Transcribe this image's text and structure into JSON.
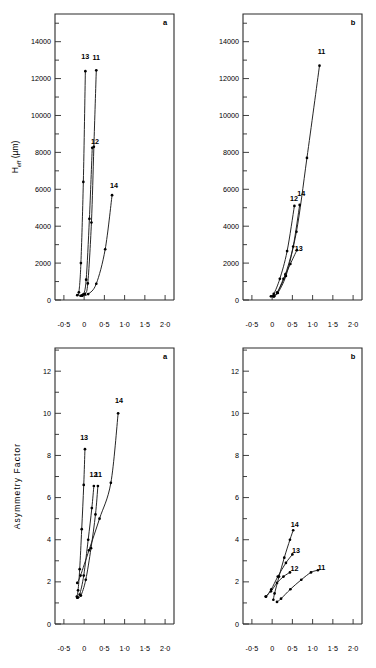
{
  "figure": {
    "panel_labels": [
      "a",
      "b",
      "a",
      "b"
    ],
    "xlabel": "k'",
    "xticklabels": [
      "-0·5",
      "0",
      "0·5",
      "1·0",
      "1·5",
      "2·0"
    ],
    "xticks": [
      -0.5,
      0,
      0.5,
      1.0,
      1.5,
      2.0
    ],
    "xlim": [
      -0.72,
      2.22
    ],
    "top_ylabel_main": "H",
    "top_ylabel_sub": "eff",
    "top_ylabel_unit": "(µm)",
    "bottom_ylabel": "Asymmetry Factor",
    "top_yticklabels": [
      "0",
      "2000",
      "4000",
      "6000",
      "8000",
      "10000",
      "12000",
      "14000"
    ],
    "top_yticks": [
      0,
      2000,
      4000,
      6000,
      8000,
      10000,
      12000,
      14000
    ],
    "top_ylim": [
      0,
      15500
    ],
    "bottom_yticklabels": [
      "0",
      "2",
      "4",
      "6",
      "8",
      "10",
      "12"
    ],
    "bottom_yticks": [
      0,
      2,
      4,
      6,
      8,
      10,
      12
    ],
    "bottom_ylim": [
      0,
      13.1
    ],
    "curve_ids": [
      "11",
      "12",
      "13",
      "14"
    ]
  },
  "chart_data": [
    {
      "type": "line",
      "title": "",
      "panel": "a",
      "position": "top-left",
      "xlabel": "k'",
      "ylabel": "H eff (µm)",
      "xlim": [
        -0.72,
        2.22
      ],
      "ylim": [
        0,
        15500
      ],
      "xticks": [
        -0.5,
        0,
        0.5,
        1.0,
        1.5,
        2.0
      ],
      "yticks": [
        0,
        2000,
        4000,
        6000,
        8000,
        10000,
        12000,
        14000
      ],
      "grid": false,
      "legend": "inline-curve-labels",
      "series": [
        {
          "name": "11",
          "label_xy": [
            0.3,
            13000
          ],
          "points": [
            [
              -0.05,
              250
            ],
            [
              0.02,
              330
            ],
            [
              0.09,
              900
            ],
            [
              0.18,
              4200
            ],
            [
              0.24,
              8300
            ],
            [
              0.3,
              12450
            ]
          ]
        },
        {
          "name": "12",
          "label_xy": [
            0.27,
            8450
          ],
          "points": [
            [
              -0.09,
              230
            ],
            [
              -0.02,
              300
            ],
            [
              0.05,
              1100
            ],
            [
              0.13,
              4400
            ],
            [
              0.2,
              8250
            ]
          ]
        },
        {
          "name": "13",
          "label_xy": [
            0.03,
            13050
          ],
          "points": [
            [
              -0.17,
              260
            ],
            [
              -0.13,
              420
            ],
            [
              -0.08,
              2000
            ],
            [
              -0.02,
              6400
            ],
            [
              0.03,
              12400
            ]
          ]
        },
        {
          "name": "14",
          "label_xy": [
            0.74,
            6050
          ],
          "points": [
            [
              -0.05,
              230
            ],
            [
              0.1,
              320
            ],
            [
              0.3,
              880
            ],
            [
              0.52,
              2750
            ],
            [
              0.69,
              5680
            ]
          ]
        }
      ]
    },
    {
      "type": "line",
      "title": "",
      "panel": "b",
      "position": "top-right",
      "xlabel": "k'",
      "ylabel": "H eff (µm)",
      "xlim": [
        -0.72,
        2.22
      ],
      "ylim": [
        0,
        15500
      ],
      "xticks": [
        -0.5,
        0,
        0.5,
        1.0,
        1.5,
        2.0
      ],
      "yticks": [
        0,
        2000,
        4000,
        6000,
        8000,
        10000,
        12000,
        14000
      ],
      "grid": false,
      "legend": "inline-curve-labels",
      "series": [
        {
          "name": "11",
          "label_xy": [
            1.22,
            13350
          ],
          "points": [
            [
              0.02,
              210
            ],
            [
              0.12,
              400
            ],
            [
              0.33,
              1400
            ],
            [
              0.6,
              3700
            ],
            [
              0.86,
              7700
            ],
            [
              1.17,
              12700
            ]
          ]
        },
        {
          "name": "12",
          "label_xy": [
            0.54,
            5350
          ],
          "points": [
            [
              -0.03,
              200
            ],
            [
              0.04,
              330
            ],
            [
              0.19,
              1150
            ],
            [
              0.37,
              2650
            ],
            [
              0.55,
              5100
            ]
          ]
        },
        {
          "name": "13",
          "label_xy": [
            0.66,
            2680
          ],
          "points": [
            [
              0.05,
              200
            ],
            [
              0.13,
              400
            ],
            [
              0.28,
              1150
            ],
            [
              0.45,
              1950
            ],
            [
              0.61,
              2700
            ]
          ]
        },
        {
          "name": "14",
          "label_xy": [
            0.72,
            5620
          ],
          "points": [
            [
              0.04,
              200
            ],
            [
              0.14,
              380
            ],
            [
              0.34,
              1300
            ],
            [
              0.52,
              2900
            ],
            [
              0.68,
              5150
            ]
          ]
        }
      ]
    },
    {
      "type": "line",
      "title": "",
      "panel": "a",
      "position": "bottom-left",
      "xlabel": "k'",
      "ylabel": "Asymmetry Factor",
      "xlim": [
        -0.72,
        2.22
      ],
      "ylim": [
        0,
        13.1
      ],
      "xticks": [
        -0.5,
        0,
        0.5,
        1.0,
        1.5,
        2.0
      ],
      "yticks": [
        0,
        2,
        4,
        6,
        8,
        10,
        12
      ],
      "grid": false,
      "legend": "inline-curve-labels",
      "series": [
        {
          "name": "11",
          "label_xy": [
            0.35,
            7.0
          ],
          "points": [
            [
              -0.16,
              1.25
            ],
            [
              -0.08,
              1.35
            ],
            [
              0.04,
              2.1
            ],
            [
              0.17,
              3.6
            ],
            [
              0.28,
              5.2
            ],
            [
              0.34,
              6.55
            ]
          ]
        },
        {
          "name": "12",
          "label_xy": [
            0.23,
            7.0
          ],
          "points": [
            [
              -0.17,
              1.25
            ],
            [
              -0.11,
              1.4
            ],
            [
              -0.01,
              2.3
            ],
            [
              0.1,
              4.0
            ],
            [
              0.19,
              5.5
            ],
            [
              0.24,
              6.55
            ]
          ]
        },
        {
          "name": "13",
          "label_xy": [
            0.0,
            8.75
          ],
          "points": [
            [
              -0.18,
              1.3
            ],
            [
              -0.15,
              1.6
            ],
            [
              -0.11,
              2.6
            ],
            [
              -0.06,
              4.5
            ],
            [
              -0.01,
              6.6
            ],
            [
              0.02,
              8.3
            ]
          ]
        },
        {
          "name": "14",
          "label_xy": [
            0.86,
            10.5
          ],
          "points": [
            [
              -0.17,
              1.95
            ],
            [
              -0.09,
              2.3
            ],
            [
              0.12,
              3.5
            ],
            [
              0.38,
              5.0
            ],
            [
              0.66,
              6.7
            ],
            [
              0.84,
              10.0
            ]
          ]
        }
      ]
    },
    {
      "type": "line",
      "title": "",
      "panel": "b",
      "position": "bottom-right",
      "xlabel": "k'",
      "ylabel": "Asymmetry Factor",
      "xlim": [
        -0.72,
        2.22
      ],
      "ylim": [
        0,
        13.1
      ],
      "xticks": [
        -0.5,
        0,
        0.5,
        1.0,
        1.5,
        2.0
      ],
      "yticks": [
        0,
        2,
        4,
        6,
        8,
        10,
        12
      ],
      "grid": false,
      "legend": "inline-curve-labels",
      "series": [
        {
          "name": "11",
          "label_xy": [
            1.22,
            2.55
          ],
          "points": [
            [
              0.12,
              1.05
            ],
            [
              0.22,
              1.2
            ],
            [
              0.45,
              1.65
            ],
            [
              0.72,
              2.1
            ],
            [
              0.96,
              2.45
            ],
            [
              1.13,
              2.55
            ]
          ]
        },
        {
          "name": "12",
          "label_xy": [
            0.55,
            2.5
          ],
          "points": [
            [
              -0.16,
              1.3
            ],
            [
              -0.03,
              1.55
            ],
            [
              0.12,
              1.95
            ],
            [
              0.28,
              2.25
            ],
            [
              0.44,
              2.45
            ]
          ]
        },
        {
          "name": "13",
          "label_xy": [
            0.59,
            3.35
          ],
          "points": [
            [
              -0.15,
              1.3
            ],
            [
              -0.02,
              1.65
            ],
            [
              0.14,
              2.25
            ],
            [
              0.34,
              2.9
            ],
            [
              0.5,
              3.3
            ]
          ]
        },
        {
          "name": "14",
          "label_xy": [
            0.56,
            4.6
          ],
          "points": [
            [
              0.03,
              1.15
            ],
            [
              0.06,
              1.45
            ],
            [
              0.17,
              2.25
            ],
            [
              0.3,
              3.15
            ],
            [
              0.44,
              4.0
            ],
            [
              0.52,
              4.45
            ]
          ]
        }
      ]
    }
  ]
}
